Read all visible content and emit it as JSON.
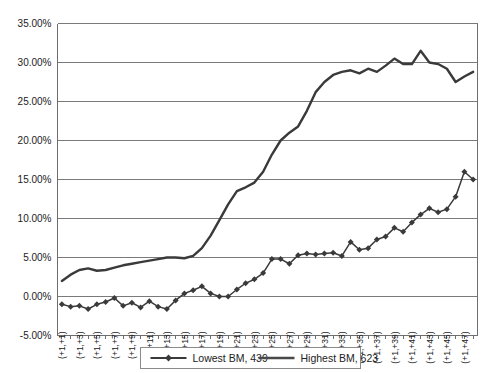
{
  "chart_data": {
    "type": "line",
    "title": "",
    "xlabel": "",
    "ylabel": "",
    "ylim": [
      -0.05,
      0.35
    ],
    "ytick_labels": [
      "35.00%",
      "30.00%",
      "25.00%",
      "20.00%",
      "15.00%",
      "10.00%",
      "5.00%",
      "0.00%",
      "-5.00%"
    ],
    "ytick_values": [
      0.35,
      0.3,
      0.25,
      0.2,
      0.15,
      0.1,
      0.05,
      0.0,
      -0.05
    ],
    "grid": true,
    "legend_position": "bottom",
    "categories": [
      "(+1,+1)",
      "(+1,+2)",
      "(+1,+3)",
      "(+1,+4)",
      "(+1,+5)",
      "(+1,+6)",
      "(+1,+7)",
      "(+1,+8)",
      "(+1,+9)",
      "(+1,+10)",
      "(+1,+11)",
      "(+1,+12)",
      "(+1,+13)",
      "(+1,+14)",
      "(+1,+15)",
      "(+1,+16)",
      "(+1,+17)",
      "(+1,+18)",
      "(+1,+19)",
      "(+1,+20)",
      "(+1,+21)",
      "(+1,+22)",
      "(+1,+23)",
      "(+1,+24)",
      "(+1,+25)",
      "(+1,+26)",
      "(+1,+27)",
      "(+1,+28)",
      "(+1,+29)",
      "(+1,+30)",
      "(+1,+31)",
      "(+1,+32)",
      "(+1,+33)",
      "(+1,+34)",
      "(+1,+35)",
      "(+1,+36)",
      "(+1,+37)",
      "(+1,+38)",
      "(+1,+39)",
      "(+1,+40)",
      "(+1,+41)",
      "(+1,+42)",
      "(+1,+43)",
      "(+1,+44)",
      "(+1,+45)",
      "(+1,+46)",
      "(+1,+47)",
      "(+1,+48)"
    ],
    "visible_xtick_labels": [
      "(+1,+1)",
      "(+1,+3)",
      "(+1,+5)",
      "(+1,+7)",
      "(+1,+9)",
      "(+1,+11)",
      "(+1,+13)",
      "(+1,+15)",
      "(+1,+17)",
      "(+1,+19)",
      "(+1,+21)",
      "(+1,+23)",
      "(+1,+25)",
      "(+1,+27)",
      "(+1,+29)",
      "(+1,+31)",
      "(+1,+33)",
      "(+1,+35)",
      "(+1,+37)",
      "(+1,+39)",
      "(+1,+41)",
      "(+1,+43)",
      "(+1,+45)",
      "(+1,+47)"
    ],
    "series": [
      {
        "name": "Lowest BM, 439",
        "marker": "diamond",
        "color": "#3a3a3a",
        "values": [
          -0.01,
          -0.013,
          -0.012,
          -0.016,
          -0.01,
          -0.007,
          -0.002,
          -0.012,
          -0.008,
          -0.014,
          -0.006,
          -0.013,
          -0.016,
          -0.005,
          0.004,
          0.008,
          0.013,
          0.004,
          0.0,
          0.0,
          0.009,
          0.017,
          0.022,
          0.03,
          0.048,
          0.048,
          0.042,
          0.053,
          0.055,
          0.054,
          0.055,
          0.056,
          0.052,
          0.07,
          0.06,
          0.062,
          0.073,
          0.077,
          0.088,
          0.083,
          0.095,
          0.105,
          0.113,
          0.108,
          0.112,
          0.128,
          0.16,
          0.15
        ]
      },
      {
        "name": "Highest BM, 623",
        "marker": "none",
        "color": "#4a4a4a",
        "values": [
          0.02,
          0.028,
          0.034,
          0.036,
          0.033,
          0.034,
          0.037,
          0.04,
          0.042,
          0.044,
          0.046,
          0.048,
          0.05,
          0.05,
          0.049,
          0.052,
          0.062,
          0.078,
          0.098,
          0.118,
          0.135,
          0.14,
          0.146,
          0.16,
          0.182,
          0.2,
          0.21,
          0.218,
          0.238,
          0.262,
          0.275,
          0.284,
          0.288,
          0.29,
          0.286,
          0.292,
          0.288,
          0.296,
          0.305,
          0.298,
          0.298,
          0.315,
          0.3,
          0.298,
          0.292,
          0.275,
          0.282,
          0.288
        ]
      }
    ]
  },
  "legend": {
    "entries": [
      {
        "label": "Lowest BM, 439"
      },
      {
        "label": "Highest BM, 623"
      }
    ]
  }
}
